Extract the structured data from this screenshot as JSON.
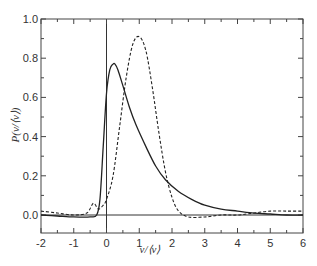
{
  "chart_data": {
    "type": "line",
    "title": "",
    "xlabel": "v/⟨v⟩",
    "ylabel": "P(v/⟨v⟩)",
    "xlim": [
      -2,
      6
    ],
    "ylim": [
      -0.08,
      1.0
    ],
    "grid": false,
    "legend": null,
    "xticks": [
      -2,
      -1,
      0,
      1,
      2,
      3,
      4,
      5,
      6
    ],
    "xtick_labels": [
      "-2",
      "-1",
      "0",
      "1",
      "2",
      "3",
      "4",
      "5",
      "6"
    ],
    "yticks": [
      0.0,
      0.2,
      0.4,
      0.6,
      0.8,
      1.0
    ],
    "ytick_labels": [
      "0.0",
      "0.2",
      "0.4",
      "0.6",
      "0.8",
      "1.0"
    ],
    "reference_lines": [
      {
        "orientation": "horizontal",
        "value": 0
      },
      {
        "orientation": "vertical",
        "value": 0
      }
    ],
    "series": [
      {
        "name": "solid",
        "style": "solid",
        "x": [
          -2.0,
          -1.5,
          -1.0,
          -0.5,
          -0.3,
          -0.2,
          -0.1,
          0.0,
          0.1,
          0.2,
          0.26,
          0.35,
          0.5,
          0.7,
          0.9,
          1.2,
          1.5,
          1.8,
          2.2,
          2.6,
          3.0,
          3.5,
          4.0,
          4.5,
          5.0,
          5.5,
          6.0
        ],
        "values": [
          0.0,
          -0.005,
          -0.01,
          -0.01,
          0.0,
          0.08,
          0.35,
          0.62,
          0.74,
          0.77,
          0.77,
          0.74,
          0.66,
          0.55,
          0.46,
          0.35,
          0.25,
          0.18,
          0.12,
          0.08,
          0.05,
          0.03,
          0.02,
          0.01,
          0.005,
          0.0,
          0.0
        ]
      },
      {
        "name": "dashed",
        "style": "dashed",
        "x": [
          -2.0,
          -1.5,
          -1.0,
          -0.6,
          -0.4,
          -0.25,
          -0.1,
          0.0,
          0.2,
          0.4,
          0.6,
          0.8,
          1.0,
          1.2,
          1.4,
          1.6,
          1.8,
          2.0,
          2.2,
          2.5,
          3.0,
          3.5,
          4.0,
          4.5,
          5.0,
          5.5,
          6.0
        ],
        "values": [
          0.02,
          0.01,
          0.0,
          0.01,
          0.06,
          0.03,
          0.05,
          0.08,
          0.2,
          0.45,
          0.7,
          0.87,
          0.91,
          0.84,
          0.65,
          0.42,
          0.22,
          0.09,
          0.02,
          -0.01,
          -0.01,
          0.0,
          0.0,
          0.01,
          0.02,
          0.02,
          0.02
        ]
      }
    ]
  }
}
